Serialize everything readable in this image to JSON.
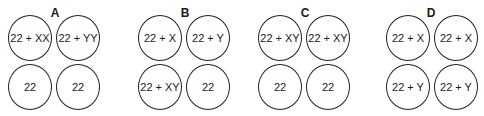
{
  "figure": {
    "panels": [
      {
        "label": "A",
        "cells": [
          "22 + XX",
          "22 + YY",
          "22",
          "22"
        ]
      },
      {
        "label": "B",
        "cells": [
          "22 + X",
          "22 + Y",
          "22 + XY",
          "22"
        ]
      },
      {
        "label": "C",
        "cells": [
          "22 + XY",
          "22 + XY",
          "22",
          "22"
        ]
      },
      {
        "label": "D",
        "cells": [
          "22 + X",
          "22 + X",
          "22 + Y",
          "22 + Y"
        ]
      }
    ]
  }
}
